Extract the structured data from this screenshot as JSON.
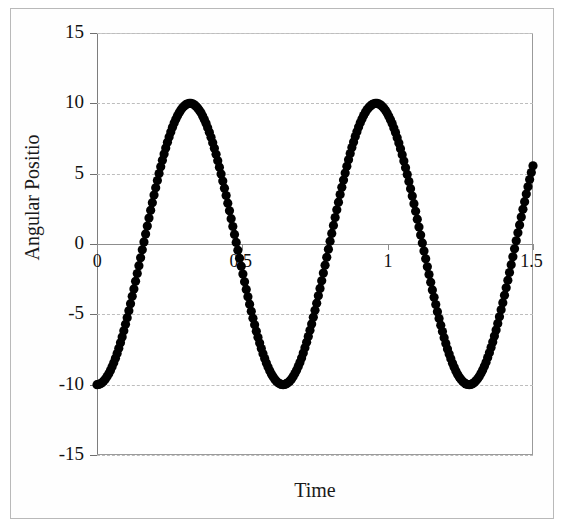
{
  "chart_data": {
    "type": "scatter",
    "title": "",
    "xlabel": "Time",
    "ylabel": "Angular Positio",
    "xlim": [
      0,
      1.5
    ],
    "ylim": [
      -15,
      15
    ],
    "grid": true,
    "legend": false,
    "marker": "filled-circle",
    "marker_color": "#000000",
    "x_ticks": [
      0,
      0.5,
      1,
      1.5
    ],
    "x_tick_labels": [
      "0",
      "0.5",
      "1",
      "1.5"
    ],
    "y_ticks": [
      15,
      10,
      5,
      0,
      -5,
      -10,
      -15
    ],
    "y_tick_labels": [
      "15",
      "10",
      "5",
      "0",
      "-5",
      "-10",
      "-15"
    ],
    "series": [
      {
        "name": "Angular Position",
        "description": "Sinusoidal oscillation, amplitude 10, period 0.64 s, starting at -10",
        "amplitude": 10,
        "period": 0.64,
        "phase": "minimum at t=0",
        "x": [
          0.0,
          0.015,
          0.03,
          0.045,
          0.06,
          0.075,
          0.09,
          0.105,
          0.12,
          0.135,
          0.15,
          0.165,
          0.18,
          0.195,
          0.21,
          0.225,
          0.24,
          0.255,
          0.27,
          0.285,
          0.3,
          0.315,
          0.33,
          0.345,
          0.36,
          0.375,
          0.39,
          0.405,
          0.42,
          0.435,
          0.45,
          0.465,
          0.48,
          0.495,
          0.51,
          0.525,
          0.54,
          0.555,
          0.57,
          0.585,
          0.6,
          0.615,
          0.63,
          0.645,
          0.66,
          0.675,
          0.69,
          0.705,
          0.72,
          0.735,
          0.75,
          0.765,
          0.78,
          0.795,
          0.81,
          0.825,
          0.84,
          0.855,
          0.87,
          0.885,
          0.9,
          0.915,
          0.93,
          0.945,
          0.96,
          0.975,
          0.99,
          1.005,
          1.02,
          1.035,
          1.05,
          1.065,
          1.08,
          1.095,
          1.11,
          1.125,
          1.14,
          1.155,
          1.17,
          1.185,
          1.2,
          1.215,
          1.23,
          1.245,
          1.26,
          1.275,
          1.29,
          1.305,
          1.32,
          1.335,
          1.35,
          1.365,
          1.38,
          1.395,
          1.41,
          1.425,
          1.44,
          1.455,
          1.47,
          1.485,
          1.5
        ],
        "y": [
          -10.0,
          -9.89,
          -9.57,
          -9.05,
          -8.33,
          -7.43,
          -6.37,
          -5.17,
          -3.87,
          -2.49,
          -1.08,
          0.34,
          1.74,
          3.07,
          4.31,
          5.44,
          6.42,
          7.24,
          7.88,
          8.33,
          8.58,
          8.63,
          8.48,
          8.14,
          7.62,
          6.94,
          6.11,
          5.17,
          4.12,
          3.01,
          1.86,
          0.7,
          -0.45,
          -1.58,
          -2.65,
          -3.65,
          -4.55,
          -5.33,
          -5.99,
          -6.5,
          -6.85,
          -7.05,
          -7.08,
          -6.95,
          -6.66,
          -6.22,
          -5.64,
          -4.93,
          -4.12,
          -3.22,
          -2.25,
          -1.24,
          -0.21,
          0.82,
          1.83,
          2.79,
          3.68,
          4.49,
          5.19,
          5.77,
          6.21,
          6.52,
          6.67,
          6.68,
          6.54,
          6.25,
          5.83,
          5.28,
          4.62,
          3.86,
          3.03,
          2.14,
          1.21,
          0.26,
          -0.68,
          -1.61,
          -2.5,
          -3.33,
          -4.08,
          -4.75,
          -5.32,
          -5.77,
          -6.09,
          -6.29,
          -6.35,
          -6.28,
          -6.08,
          -5.75,
          -5.31,
          -4.76,
          -4.11,
          -3.38,
          -2.59,
          -1.75,
          -0.88,
          0.0,
          0.88,
          1.74,
          2.57,
          3.35,
          4.08
        ]
      }
    ]
  },
  "axes": {
    "ylabel_text": "Angular Positio",
    "xlabel_text": "Time"
  }
}
